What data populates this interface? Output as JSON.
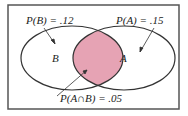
{
  "diagram": {
    "type": "venn",
    "sets": [
      {
        "label": "B",
        "annotation": "P(B) = .12"
      },
      {
        "label": "A",
        "annotation": "P(A) = .15"
      }
    ],
    "intersection": {
      "annotation": "P(A∩B) = .05",
      "fill": "#e6a3b4"
    },
    "colors": {
      "stroke": "#333333",
      "border": "#555555",
      "intersection": "#e6a3b4"
    }
  }
}
